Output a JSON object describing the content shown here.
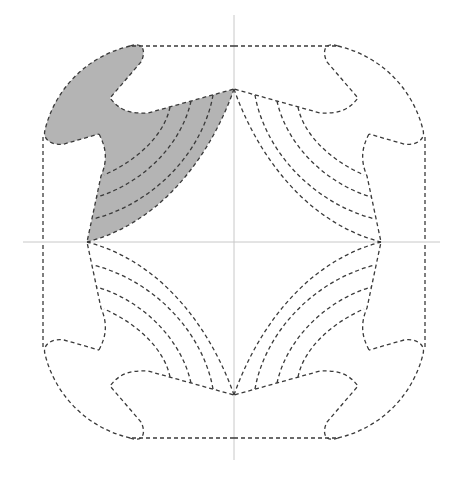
{
  "diagram": {
    "type": "four-quadrant-symmetric-outline",
    "center": [
      234,
      242
    ],
    "colors": {
      "background": "#ffffff",
      "outline": "#3a3a3a",
      "axis": "#c8c8c8",
      "highlight_fill": "#b4b4b4"
    },
    "axes": {
      "horizontal": {
        "x1": 23,
        "x2": 440,
        "y": 242
      },
      "vertical": {
        "x": 234,
        "y1": 15,
        "y2": 460
      }
    },
    "quadrants": [
      "top-left",
      "top-right",
      "bottom-left",
      "bottom-right"
    ],
    "highlighted_quadrant": "top-left",
    "arcs_per_pole": 4,
    "line_style": "dashed"
  }
}
